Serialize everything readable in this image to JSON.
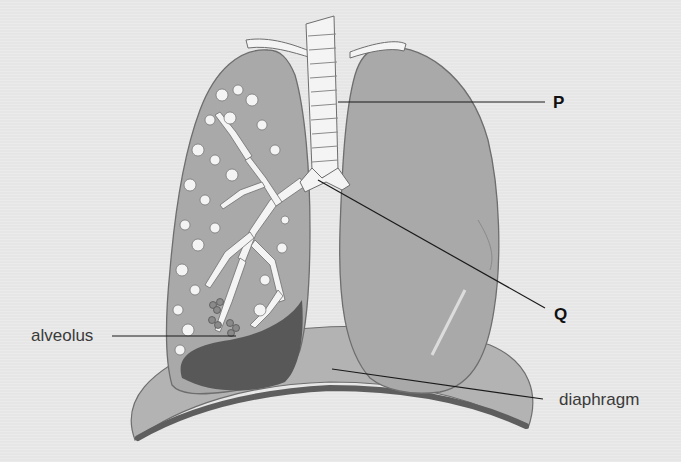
{
  "figure": {
    "labels": {
      "p": "P",
      "q": "Q",
      "alveolus": "alveolus",
      "diaphragm": "diaphragm"
    },
    "colors": {
      "background": "#e6e6e6",
      "lung": "#a9a9a9",
      "lung_dark": "#5a5a5a",
      "diaphragm": "#b3b3b3",
      "airway": "#f4f4f4",
      "outline": "#6e6e6e",
      "leader_line": "#1a1a1a"
    }
  }
}
